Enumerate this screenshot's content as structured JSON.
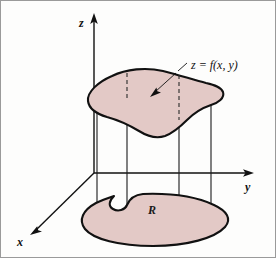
{
  "figure": {
    "name": "volume-under-surface-over-region",
    "background_color": "#fdfdfc",
    "border_color": "#9a9a9a",
    "surface_fill_color": "#e3c9c6",
    "outline_color": "#111111",
    "axis_color": "#111111"
  },
  "axes": {
    "z_label": "z",
    "y_label": "y",
    "x_label": "x",
    "origin": {
      "x": 93,
      "y": 172
    }
  },
  "labels": {
    "surface_callout": "z = f(x, y)",
    "region_label": "R"
  },
  "geometry": {
    "vertical_line_x_positions": [
      96,
      126,
      178,
      210
    ],
    "surface_dashed_line_x_positions": [
      126,
      178
    ],
    "z_axis": {
      "x": 93,
      "top_y": 14,
      "bottom_y": 172
    },
    "y_axis": {
      "y": 172,
      "left_x": 93,
      "right_x": 251
    },
    "x_axis": {
      "from_x": 93,
      "from_y": 172,
      "to_x": 30,
      "to_y": 233
    },
    "callout_leader": {
      "from_x": 172,
      "from_y": 74,
      "to_x": 152,
      "to_y": 93
    }
  }
}
